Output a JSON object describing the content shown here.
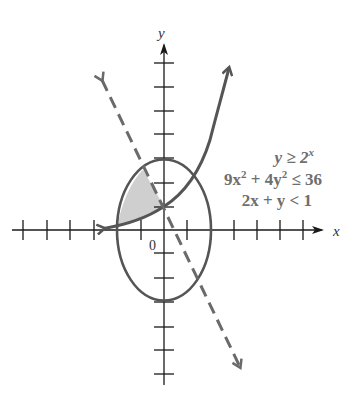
{
  "figure": {
    "axes": {
      "x_label": "x",
      "y_label": "y",
      "origin_label": "0",
      "x_ticks": [
        -6,
        -5,
        -4,
        -3,
        -2,
        -1,
        1,
        2,
        3,
        4,
        5,
        6
      ],
      "y_ticks": [
        -6,
        -5,
        -4,
        -3,
        -2,
        -1,
        1,
        2,
        3,
        4,
        5,
        6,
        7
      ],
      "x_range": [
        -6.5,
        7
      ],
      "y_range": [
        -6.5,
        7.5
      ]
    },
    "inequalities": [
      {
        "text": "y ≥ 2",
        "sup": "x",
        "id": "exp"
      },
      {
        "text": "9x² + 4y² ≤ 36",
        "id": "ellipse"
      },
      {
        "text": "2x + y < 1",
        "id": "line"
      }
    ],
    "inequality_line1_base": "y ≥ 2",
    "inequality_line1_exp": "x",
    "inequality_line2_a": "9x",
    "inequality_line2_sup1": "2",
    "inequality_line2_b": " + 4y",
    "inequality_line2_sup2": "2",
    "inequality_line2_c": " ≤ 36",
    "inequality_line3": "2x + y < 1",
    "curves": {
      "exponential": {
        "equation": "y = 2^x",
        "style": "solid",
        "boundary_included": true
      },
      "ellipse": {
        "equation": "9x^2 + 4y^2 = 36",
        "semi_axis_x": 2,
        "semi_axis_y": 3,
        "style": "solid",
        "boundary_included": true
      },
      "line": {
        "equation": "2x + y = 1",
        "style": "dashed",
        "boundary_included": false
      }
    },
    "shaded_region": "Solution set: inside ellipse, above y = 2^x, and below line 2x + y = 1",
    "colors": {
      "axis": "#1a1a1a",
      "curve": "#555555",
      "dashed_line": "#6a6a6a",
      "shade": "#cfcfcf",
      "text": "#6e6e6e"
    }
  }
}
